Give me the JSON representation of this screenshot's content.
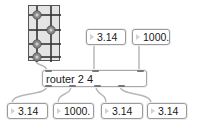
{
  "matrix": {
    "rows": 4,
    "columns": 2,
    "active_cells": [
      [
        0,
        0
      ],
      [
        1,
        1
      ],
      [
        2,
        0
      ],
      [
        3,
        0
      ]
    ]
  },
  "inputs": [
    {
      "value": "3.14"
    },
    {
      "value": "1000."
    }
  ],
  "router": {
    "text": "router 2 4",
    "inlets": 3,
    "outlets": 4
  },
  "outputs": [
    {
      "value": "3.14"
    },
    {
      "value": "1000."
    },
    {
      "value": "3.14"
    },
    {
      "value": "3.14"
    }
  ],
  "colors": {
    "cord": "#b8b8b8",
    "box_border": "#9a9a9a",
    "matrix_line": "#333333",
    "knob": "#8a8a8a"
  }
}
